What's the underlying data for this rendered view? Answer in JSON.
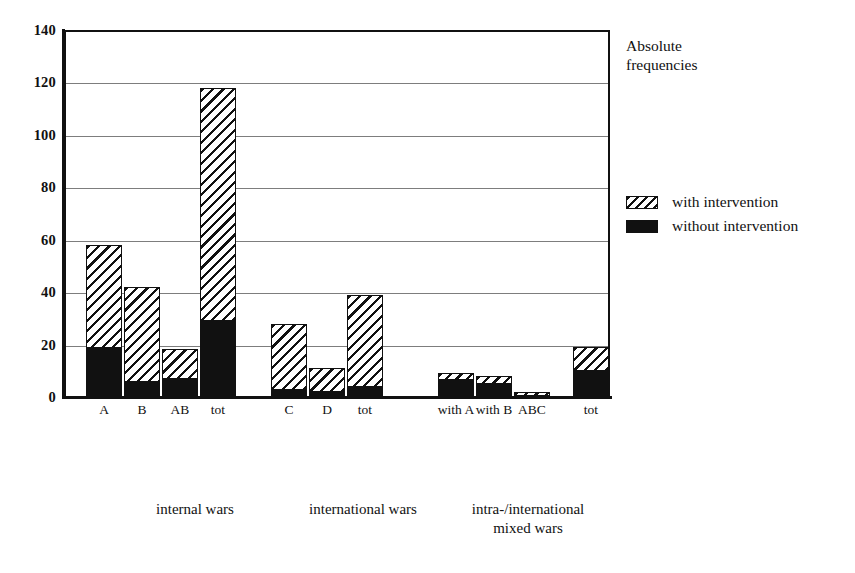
{
  "chart_data": {
    "type": "bar",
    "title": "",
    "subtitle": "",
    "annotation": "Absolute\nfrequencies",
    "xlabel": "",
    "ylabel": "",
    "ylim": [
      0,
      140
    ],
    "ytick_labels": [
      "0",
      "20",
      "40",
      "60",
      "80",
      "100",
      "120",
      "140"
    ],
    "ytick_values": [
      0,
      20,
      40,
      60,
      80,
      100,
      120,
      140
    ],
    "grid": true,
    "grid_axis": "y",
    "stacked": true,
    "legend_position": "right",
    "legend": [
      {
        "name": "with intervention",
        "fill": "hatched",
        "color": "#111111"
      },
      {
        "name": "without intervention",
        "fill": "solid",
        "color": "#111111"
      }
    ],
    "series": [
      {
        "name": "without intervention",
        "values": [
          19,
          6,
          7,
          29,
          3,
          2,
          4,
          6.5,
          5,
          0.5,
          10
        ]
      },
      {
        "name": "with intervention",
        "values": [
          39,
          36,
          11.5,
          89,
          25,
          9,
          35,
          2.5,
          3,
          1.5,
          9
        ]
      }
    ],
    "totals": [
      58,
      42,
      18.5,
      118,
      28,
      11,
      39,
      9,
      8,
      2,
      19
    ],
    "categories": [
      "A",
      "B",
      "AB",
      "tot",
      "C",
      "D",
      "tot",
      "with A",
      "with B",
      "ABC",
      "tot"
    ],
    "groups": [
      {
        "label": "internal wars",
        "categories": [
          "A",
          "B",
          "AB",
          "tot"
        ]
      },
      {
        "label": "international wars",
        "categories": [
          "C",
          "D",
          "tot"
        ]
      },
      {
        "label": "intra-/international\nmixed wars",
        "categories": [
          "with A",
          "with B",
          "ABC",
          "tot"
        ]
      }
    ]
  },
  "bars": [
    {
      "label": "A",
      "total": 58,
      "black": 19,
      "x": 86,
      "w": 36
    },
    {
      "label": "B",
      "total": 42,
      "black": 6,
      "x": 124,
      "w": 36
    },
    {
      "label": "AB",
      "total": 18.5,
      "black": 7,
      "x": 162,
      "w": 36
    },
    {
      "label": "tot",
      "total": 118,
      "black": 29,
      "x": 200,
      "w": 36
    },
    {
      "label": "C",
      "total": 28,
      "black": 3,
      "x": 271,
      "w": 36
    },
    {
      "label": "D",
      "total": 11,
      "black": 2,
      "x": 309,
      "w": 36
    },
    {
      "label": "tot",
      "total": 39,
      "black": 4,
      "x": 347,
      "w": 36
    },
    {
      "label": "with A",
      "total": 9,
      "black": 6.5,
      "x": 438,
      "w": 36
    },
    {
      "label": "with B",
      "total": 8,
      "black": 5,
      "x": 476,
      "w": 36
    },
    {
      "label": "ABC",
      "total": 2,
      "black": 0.5,
      "x": 514,
      "w": 36
    },
    {
      "label": "tot",
      "total": 19,
      "black": 10,
      "x": 573,
      "w": 36
    }
  ],
  "axis": {
    "y_ticks": [
      "140",
      "120",
      "100",
      "80",
      "60",
      "40",
      "20",
      "0"
    ]
  },
  "side_note": {
    "text": "Absolute\nfrequencies"
  },
  "legend": {
    "items": [
      {
        "label": "with intervention"
      },
      {
        "label": "without intervention"
      }
    ]
  },
  "group_captions": [
    {
      "text": "internal wars",
      "x": 90,
      "w": 210
    },
    {
      "text": "international wars",
      "x": 258,
      "w": 210
    },
    {
      "text": "intra-/international\nmixed wars",
      "x": 428,
      "w": 200
    }
  ]
}
